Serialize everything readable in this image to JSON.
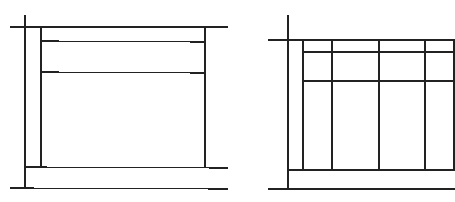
{
  "canvas": {
    "width": 455,
    "height": 202,
    "background": "#ffffff"
  },
  "stroke": {
    "color": "#222222",
    "width": 1.2
  },
  "diagrams": [
    {
      "name": "left-layout-wireframe",
      "lines": [
        {
          "id": "left-axis-vertical",
          "x1": 25,
          "y1": 15,
          "x2": 25,
          "y2": 188
        },
        {
          "id": "top-rule",
          "x1": 10,
          "y1": 27,
          "x2": 228,
          "y2": 27
        },
        {
          "id": "inner-left",
          "x1": 41,
          "y1": 27,
          "x2": 41,
          "y2": 167
        },
        {
          "id": "inner-right",
          "x1": 205,
          "y1": 27,
          "x2": 205,
          "y2": 167
        },
        {
          "id": "header-divider-1",
          "x1": 41,
          "y1": 41,
          "x2": 205,
          "y2": 42
        },
        {
          "id": "header-divider-2",
          "x1": 41,
          "y1": 72,
          "x2": 205,
          "y2": 73
        },
        {
          "id": "footer-top-rule",
          "x1": 25,
          "y1": 167,
          "x2": 228,
          "y2": 168
        },
        {
          "id": "bottom-rule",
          "x1": 10,
          "y1": 188,
          "x2": 228,
          "y2": 189
        }
      ]
    },
    {
      "name": "right-table-wireframe",
      "lines": [
        {
          "id": "left-axis-vertical",
          "x1": 288,
          "y1": 15,
          "x2": 288,
          "y2": 189
        },
        {
          "id": "top-rule",
          "x1": 268,
          "y1": 40,
          "x2": 455,
          "y2": 40
        },
        {
          "id": "col-line-1",
          "x1": 303,
          "y1": 40,
          "x2": 303,
          "y2": 170
        },
        {
          "id": "col-line-2",
          "x1": 332,
          "y1": 40,
          "x2": 332,
          "y2": 170
        },
        {
          "id": "col-line-3",
          "x1": 379,
          "y1": 40,
          "x2": 379,
          "y2": 170
        },
        {
          "id": "col-line-4",
          "x1": 425,
          "y1": 40,
          "x2": 425,
          "y2": 170
        },
        {
          "id": "col-line-5",
          "x1": 454,
          "y1": 40,
          "x2": 454,
          "y2": 170
        },
        {
          "id": "header-divider-1",
          "x1": 303,
          "y1": 52,
          "x2": 455,
          "y2": 52
        },
        {
          "id": "header-divider-2",
          "x1": 303,
          "y1": 81,
          "x2": 455,
          "y2": 81
        },
        {
          "id": "footer-top-rule",
          "x1": 288,
          "y1": 170,
          "x2": 455,
          "y2": 170
        },
        {
          "id": "bottom-rule",
          "x1": 268,
          "y1": 189,
          "x2": 455,
          "y2": 189
        }
      ]
    }
  ]
}
